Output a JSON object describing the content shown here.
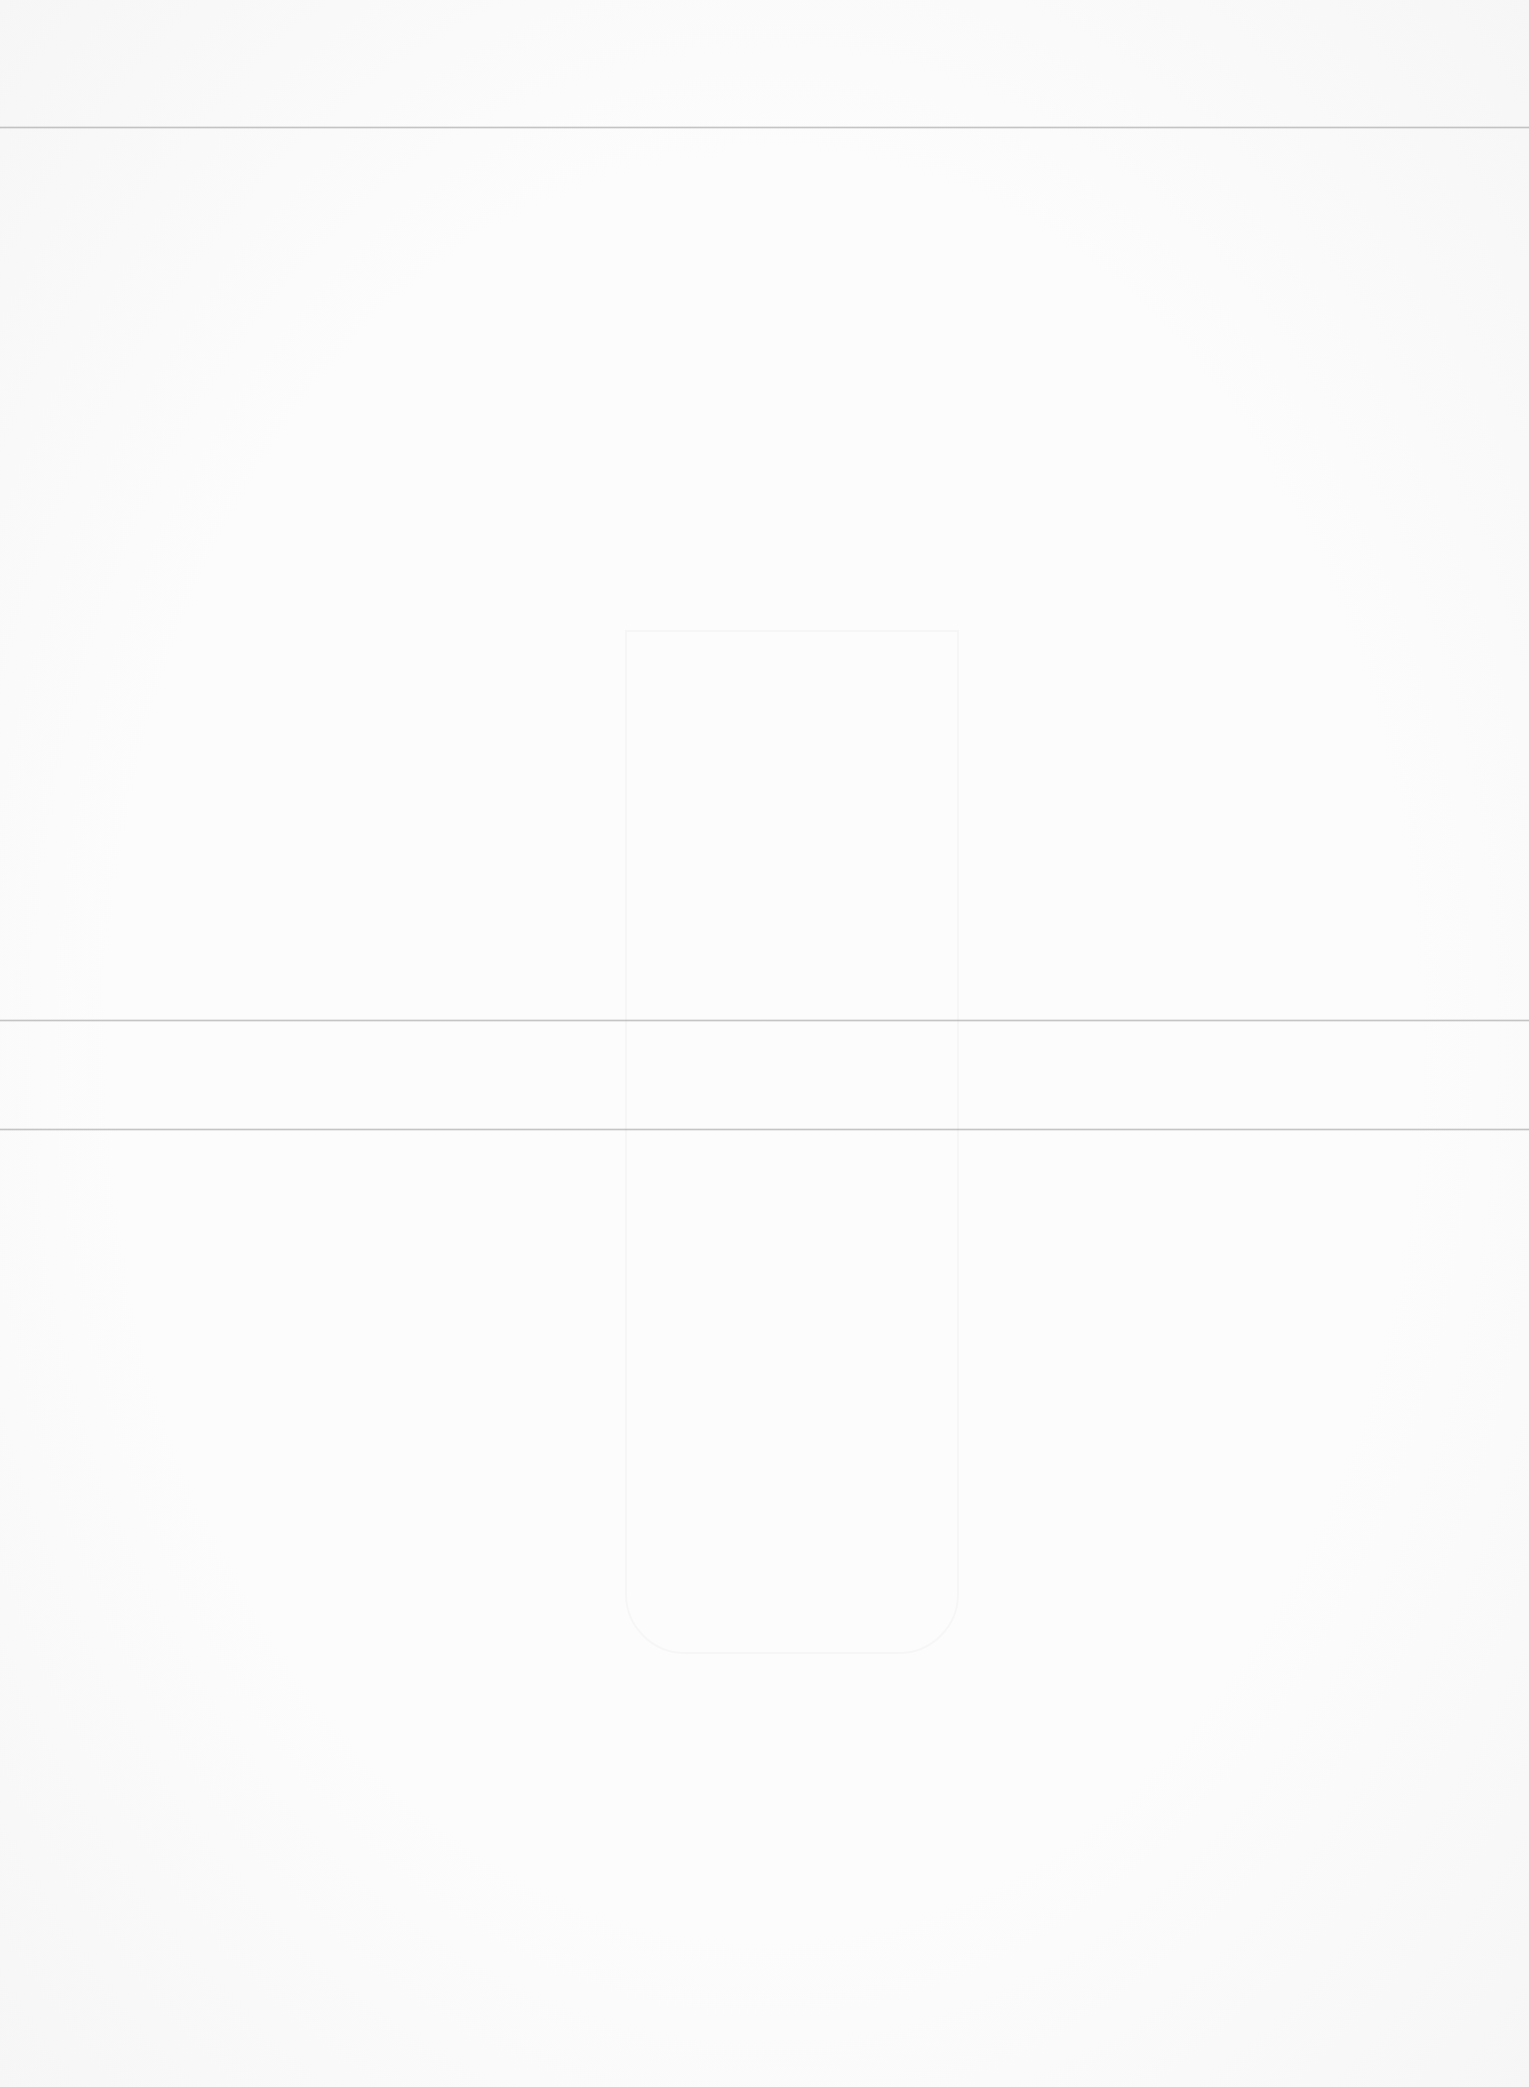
{
  "document": {
    "type": "scanned-page",
    "visible_text": "",
    "show_through_text": "",
    "fold_lines": [
      {
        "y": 127
      },
      {
        "y": 1020
      },
      {
        "y": 1129
      }
    ],
    "colors": {
      "paper": "#fcfcfc",
      "fold_line": "#969696"
    }
  }
}
